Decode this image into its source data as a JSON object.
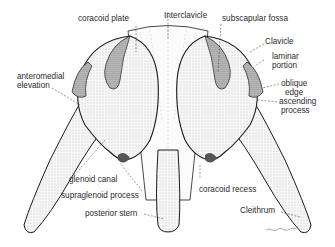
{
  "figure": {
    "colors": {
      "ink": "#1a1a1a",
      "label": "#2b2b2b",
      "bone_fill": "#f4f4f4",
      "shade": "#9a9a9a",
      "background": "#ffffff"
    },
    "labels": {
      "coracoid_plate": "coracoid plate",
      "interclavicle": "Interclavicle",
      "subscapular_fossa": "subscapular fossa",
      "clavicle": "Clavicle",
      "laminar_portion_1": "laminar",
      "laminar_portion_2": "portion",
      "oblique_edge_1": "oblique",
      "oblique_edge_2": "edge",
      "ascending_process_1": "ascending",
      "ascending_process_2": "process",
      "anteromedial_elevation_1": "anteromedial",
      "anteromedial_elevation_2": "elevation",
      "glenoid_canal": "glenoid canal",
      "supraglenoid_process": "supraglenoid process",
      "posterior_stern": "posterior stern",
      "coracoid_recess": "coracoid recess",
      "cleithrum": "Cleithrum"
    },
    "signature": "artist signature (illegible)"
  }
}
